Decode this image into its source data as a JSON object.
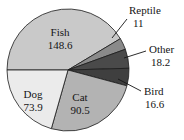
{
  "chart_data": {
    "type": "pie",
    "title": "",
    "subtitle": "",
    "xlabel": "",
    "ylabel": "",
    "legend_position": "none",
    "grid": false,
    "total": 358.8,
    "start_angle_deg": 180,
    "direction": "clockwise",
    "categories": [
      "Fish",
      "Reptile",
      "Other",
      "Bird",
      "Cat",
      "Dog"
    ],
    "values": [
      148.6,
      11,
      18.2,
      16.6,
      90.5,
      73.9
    ],
    "slices": [
      {
        "name": "Fish",
        "label": "Fish",
        "value_label": "148.6",
        "value": 148.6,
        "color": "#c9c9c9",
        "label_placement": "inside",
        "label_x": 60,
        "label_y": 33
      },
      {
        "name": "Reptile",
        "label": "Reptile",
        "value_label": "11",
        "value": 11,
        "color": "#8a8a8a",
        "label_placement": "callout",
        "label_x": 129,
        "label_y": 11,
        "value_x": 133,
        "value_y": 24,
        "leader_x1": 112,
        "leader_y1": 38,
        "leader_x2": 127,
        "leader_y2": 19
      },
      {
        "name": "Other",
        "label": "Other",
        "value_label": "18.2",
        "value": 18.2,
        "color": "#4a4a4a",
        "label_placement": "callout",
        "label_x": 149,
        "label_y": 50,
        "value_x": 151,
        "value_y": 63,
        "leader_x1": 124,
        "leader_y1": 58,
        "leader_x2": 146,
        "leader_y2": 51
      },
      {
        "name": "Bird",
        "label": "Bird",
        "value_label": "16.6",
        "value": 16.6,
        "color": "#3f3f3f",
        "label_placement": "callout",
        "label_x": 144,
        "label_y": 92,
        "value_x": 145,
        "value_y": 105,
        "leader_x1": 118,
        "leader_y1": 79,
        "leader_x2": 141,
        "leader_y2": 91
      },
      {
        "name": "Cat",
        "label": "Cat",
        "value_label": "90.5",
        "value": 90.5,
        "color": "#b3b3b3",
        "label_placement": "inside",
        "label_x": 80,
        "label_y": 98
      },
      {
        "name": "Dog",
        "label": "Dog",
        "value_label": "73.9",
        "value": 73.9,
        "color": "#ebebeb",
        "label_placement": "inside",
        "label_x": 33,
        "label_y": 95
      }
    ],
    "geometry": {
      "center_x": 68,
      "center_y": 70,
      "radius": 61
    }
  }
}
